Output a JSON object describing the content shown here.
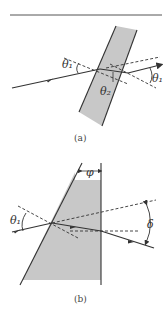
{
  "figure_a": {
    "caption": "(a)",
    "labels": {
      "incidence_angle": "θ₁",
      "refraction_angle": "θ₂",
      "exit_angle": "θ₁"
    }
  },
  "figure_b": {
    "caption": "(b)",
    "labels": {
      "incidence_angle": "θ₁",
      "prism_angle": "φ",
      "deviation_angle": "δ"
    }
  },
  "colors": {
    "glass": "#c8c8c8",
    "line": "#333333"
  }
}
